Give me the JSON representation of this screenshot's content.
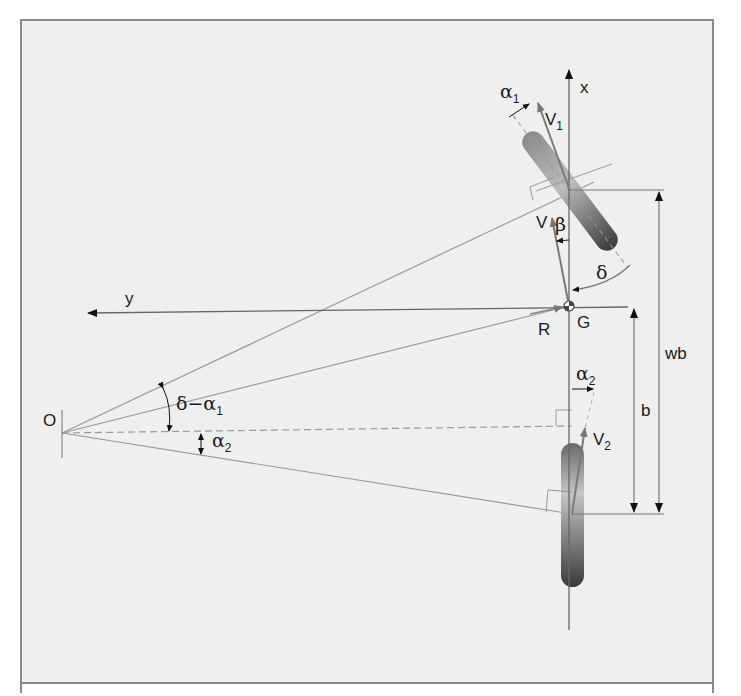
{
  "diagram": {
    "colors": {
      "background": "#efefef",
      "frame": "#8a8a8a",
      "line": "#8f8f8f",
      "axis": "#555555",
      "arrow": "#111111",
      "wheel_dark": "#3a3a3a",
      "wheel_light": "#bdbdbd"
    },
    "labels": {
      "x_axis": "x",
      "y_axis": "y",
      "origin": "O",
      "cg": "G",
      "radius": "R",
      "wheelbase": "wb",
      "rear_distance": "b",
      "velocity": "V",
      "beta": "β",
      "delta": "δ",
      "v1": "V",
      "v1_sub": "1",
      "v2": "V",
      "v2_sub": "2",
      "alpha1": "α",
      "alpha1_sub": "1",
      "alpha2_top": "α",
      "alpha2_top_sub": "2",
      "alpha2_left": "α",
      "alpha2_left_sub": "2",
      "delta_minus_alpha1": "δ−α",
      "delta_minus_alpha1_sub": "1"
    }
  }
}
